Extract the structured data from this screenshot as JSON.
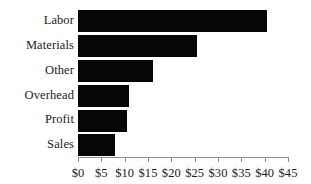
{
  "chart_data": {
    "type": "bar",
    "orientation": "horizontal",
    "title": "",
    "subtitle": "",
    "xlabel": "",
    "ylabel": "",
    "categories": [
      "Labor",
      "Materials",
      "Other",
      "Overhead",
      "Profit",
      "Sales"
    ],
    "values": [
      40.5,
      25.5,
      16,
      11,
      10.5,
      8
    ],
    "value_prefix": "$",
    "xlim": [
      0,
      45
    ],
    "xticks": [
      0,
      5,
      10,
      15,
      20,
      25,
      30,
      35,
      40,
      45
    ],
    "xtick_labels": [
      "$0",
      "$5",
      "$10",
      "$15",
      "$20",
      "$25",
      "$30",
      "$35",
      "$40",
      "$45"
    ],
    "grid": false,
    "legend": false,
    "legend_position": "none",
    "series": [
      {
        "name": "Cost",
        "values": [
          40.5,
          25.5,
          16,
          11,
          10.5,
          8
        ]
      }
    ],
    "colors": {
      "bar_fill": "#060606",
      "axis_line": "#8d8d8d",
      "text": "#1a1a1a",
      "background": "#ffffff"
    }
  }
}
